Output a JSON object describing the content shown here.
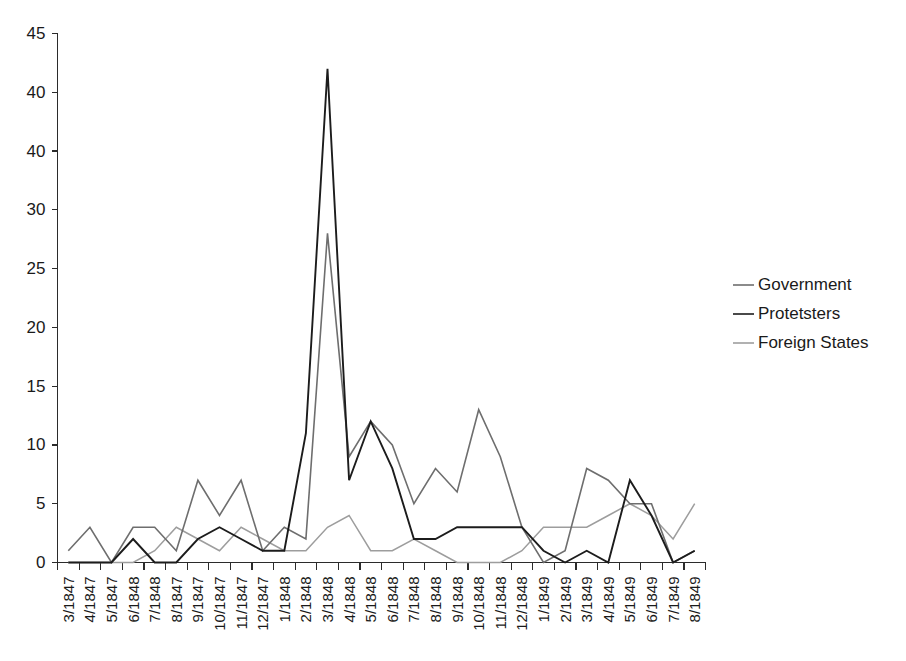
{
  "chart_data": {
    "type": "line",
    "title": "",
    "xlabel": "",
    "ylabel": "",
    "ylim": [
      0,
      45
    ],
    "ytick_labels": [
      "45",
      "40",
      "40",
      "30",
      "25",
      "20",
      "15",
      "10",
      "5",
      "0"
    ],
    "ytick_values": [
      45,
      40,
      35,
      30,
      25,
      20,
      15,
      10,
      5,
      0
    ],
    "grid": false,
    "legend_position": "right",
    "categories": [
      "3/1847",
      "4/1847",
      "5/1847",
      "6/1848",
      "7/1848",
      "8/1847",
      "9/1847",
      "10/1847",
      "11/1847",
      "12/1847",
      "1/1848",
      "2/1848",
      "3/1848",
      "4/1848",
      "5/1848",
      "6/1848",
      "7/1848",
      "8/1848",
      "9/1848",
      "10/1848",
      "11/1848",
      "12/1848",
      "1/1849",
      "2/1849",
      "3/1849",
      "4/1849",
      "5/1849",
      "6/1849",
      "7/1849",
      "8/1849"
    ],
    "series": [
      {
        "name": "Government",
        "color": "#6e6e6e",
        "width": 1.6,
        "values": [
          1,
          3,
          0,
          3,
          3,
          1,
          7,
          4,
          7,
          1,
          3,
          2,
          28,
          9,
          12,
          10,
          5,
          8,
          6,
          13,
          9,
          3,
          0,
          1,
          8,
          7,
          5,
          5,
          0,
          1
        ]
      },
      {
        "name": "Protetsters",
        "color": "#1c1c1c",
        "width": 1.9,
        "values": [
          0,
          0,
          0,
          2,
          0,
          0,
          2,
          3,
          2,
          1,
          1,
          11,
          42,
          7,
          12,
          8,
          2,
          2,
          3,
          3,
          3,
          3,
          1,
          0,
          1,
          0,
          7,
          4,
          0,
          1
        ]
      },
      {
        "name": "Foreign States",
        "color": "#9d9d9d",
        "width": 1.5,
        "values": [
          0,
          0,
          0,
          0,
          1,
          3,
          2,
          1,
          3,
          2,
          1,
          1,
          3,
          4,
          1,
          1,
          2,
          1,
          0,
          0,
          0,
          1,
          3,
          3,
          3,
          4,
          5,
          4,
          2,
          5
        ]
      }
    ]
  },
  "legend": {
    "items": [
      {
        "label": "Government",
        "color": "#6e6e6e"
      },
      {
        "label": "Protetsters",
        "color": "#1c1c1c"
      },
      {
        "label": "Foreign States",
        "color": "#9d9d9d"
      }
    ]
  }
}
